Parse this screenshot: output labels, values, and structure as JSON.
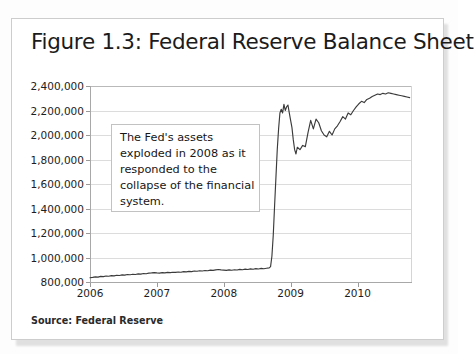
{
  "figure": {
    "title": "Figure 1.3: Federal Reserve Balance Sheet",
    "source": "Source: Federal Reserve",
    "annotation": "The Fed's assets exploded  in 2008 as it responded  to the collapse  of the financial system."
  },
  "colors": {
    "line": "#3b3b3b",
    "grid": "#dcdcdc",
    "axis": "#a8a8a8",
    "card_background": "#ffffff",
    "card_border": "#cdcdcd",
    "text": "#1b1b1b",
    "annotation_border": "#c2c2c2"
  },
  "chart_data": {
    "type": "line",
    "title": "Figure 1.3: Federal Reserve Balance Sheet",
    "subtitle": "",
    "xlabel": "",
    "ylabel": "",
    "grid": true,
    "legend": "none",
    "annotations": [
      {
        "text": "The Fed's assets exploded  in 2008 as it responded  to the collapse  of the financial system.",
        "x_year": 2006.3,
        "y_value": 2060000
      }
    ],
    "xlim": [
      2006.0,
      2010.8
    ],
    "ylim": [
      800000,
      2400000
    ],
    "xticks": [
      2006,
      2007,
      2008,
      2009,
      2010
    ],
    "xtick_labels": [
      "2006",
      "2007",
      "2008",
      "2009",
      "2010"
    ],
    "yticks": [
      800000,
      1000000,
      1200000,
      1400000,
      1600000,
      1800000,
      2000000,
      2200000,
      2400000
    ],
    "ytick_labels": [
      "800,000",
      "1,000,000",
      "1,200,000",
      "1,400,000",
      "1,600,000",
      "1,800,000",
      "2,000,000",
      "2,200,000",
      "2,400,000"
    ],
    "series": [
      {
        "name": "Federal Reserve Total Assets",
        "units": "Millions of dollars",
        "x": [
          2006.0,
          2006.04,
          2006.08,
          2006.12,
          2006.16,
          2006.2,
          2006.24,
          2006.28,
          2006.32,
          2006.36,
          2006.4,
          2006.44,
          2006.48,
          2006.52,
          2006.56,
          2006.6,
          2006.64,
          2006.68,
          2006.72,
          2006.76,
          2006.8,
          2006.84,
          2006.88,
          2006.92,
          2006.96,
          2007.0,
          2007.04,
          2007.08,
          2007.12,
          2007.16,
          2007.2,
          2007.24,
          2007.28,
          2007.32,
          2007.36,
          2007.4,
          2007.44,
          2007.48,
          2007.52,
          2007.56,
          2007.6,
          2007.64,
          2007.68,
          2007.72,
          2007.76,
          2007.8,
          2007.84,
          2007.88,
          2007.92,
          2007.96,
          2008.0,
          2008.04,
          2008.08,
          2008.12,
          2008.16,
          2008.2,
          2008.24,
          2008.28,
          2008.32,
          2008.36,
          2008.4,
          2008.44,
          2008.48,
          2008.52,
          2008.56,
          2008.6,
          2008.64,
          2008.68,
          2008.7,
          2008.72,
          2008.74,
          2008.76,
          2008.78,
          2008.8,
          2008.82,
          2008.84,
          2008.86,
          2008.88,
          2008.9,
          2008.92,
          2008.94,
          2008.96,
          2008.98,
          2009.0,
          2009.02,
          2009.04,
          2009.06,
          2009.08,
          2009.1,
          2009.14,
          2009.18,
          2009.22,
          2009.26,
          2009.3,
          2009.34,
          2009.38,
          2009.42,
          2009.46,
          2009.5,
          2009.54,
          2009.58,
          2009.62,
          2009.66,
          2009.7,
          2009.74,
          2009.78,
          2009.82,
          2009.86,
          2009.9,
          2009.94,
          2009.98,
          2010.02,
          2010.06,
          2010.1,
          2010.14,
          2010.18,
          2010.22,
          2010.26,
          2010.3,
          2010.34,
          2010.38,
          2010.42,
          2010.46,
          2010.5,
          2010.54,
          2010.58,
          2010.62,
          2010.66,
          2010.7,
          2010.74,
          2010.78
        ],
        "y": [
          835000,
          838000,
          842000,
          840000,
          846000,
          844000,
          849000,
          847000,
          852000,
          850000,
          855000,
          853000,
          858000,
          856000,
          861000,
          859000,
          863000,
          861000,
          866000,
          864000,
          869000,
          867000,
          872000,
          874000,
          877000,
          874000,
          872000,
          876000,
          874000,
          878000,
          876000,
          880000,
          878000,
          882000,
          880000,
          885000,
          883000,
          887000,
          885000,
          890000,
          888000,
          892000,
          890000,
          894000,
          892000,
          897000,
          895000,
          899000,
          902000,
          899000,
          897000,
          895000,
          899000,
          896000,
          900000,
          898000,
          903000,
          900000,
          905000,
          902000,
          907000,
          904000,
          909000,
          906000,
          911000,
          908000,
          912000,
          915000,
          925000,
          1010000,
          1180000,
          1420000,
          1650000,
          1880000,
          2050000,
          2180000,
          2210000,
          2180000,
          2250000,
          2200000,
          2230000,
          2245000,
          2180000,
          2120000,
          2060000,
          1960000,
          1880000,
          1845000,
          1900000,
          1880000,
          1915000,
          1905000,
          2020000,
          2120000,
          2050000,
          2130000,
          2100000,
          2035000,
          2000000,
          1985000,
          2030000,
          2000000,
          2050000,
          2075000,
          2110000,
          2150000,
          2130000,
          2180000,
          2165000,
          2200000,
          2230000,
          2255000,
          2275000,
          2265000,
          2290000,
          2300000,
          2315000,
          2325000,
          2335000,
          2330000,
          2340000,
          2335000,
          2345000,
          2340000,
          2335000,
          2330000,
          2325000,
          2320000,
          2315000,
          2310000,
          2305000
        ]
      }
    ]
  },
  "axis_render": {
    "ytick_positions_px": [
      196,
      171.5,
      147,
      122.5,
      98,
      73.5,
      49,
      24.5,
      0
    ],
    "xtick_positions_px": [
      0,
      67,
      134,
      201,
      268
    ]
  }
}
